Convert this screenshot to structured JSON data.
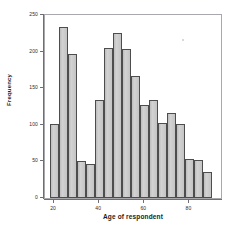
{
  "chart_data": {
    "type": "bar",
    "title": "",
    "xlabel": "Age of respondent",
    "ylabel": "Frequency",
    "ylim": [
      0,
      250
    ],
    "xlim": [
      16,
      94
    ],
    "grid": false,
    "legend": null,
    "bin_width": 4,
    "x_ticks": [
      20,
      40,
      60,
      80
    ],
    "y_ticks": [
      0,
      50,
      100,
      150,
      200,
      250
    ],
    "x_tick_labels": [
      "20",
      "40",
      "60",
      "80"
    ],
    "y_tick_labels": [
      "0",
      "50",
      "100",
      "150",
      "200",
      "250"
    ],
    "bin_starts": [
      18,
      22,
      26,
      30,
      34,
      38,
      42,
      46,
      50,
      54,
      58,
      62,
      66,
      70,
      74,
      78,
      82,
      86
    ],
    "categories": [
      "18-22",
      "22-26",
      "26-30",
      "30-34",
      "34-38",
      "38-42",
      "42-46",
      "46-50",
      "50-54",
      "54-58",
      "58-62",
      "62-66",
      "66-70",
      "70-74",
      "74-78",
      "78-82",
      "82-86",
      "86-90"
    ],
    "values": [
      101,
      233,
      197,
      51,
      47,
      134,
      205,
      226,
      203,
      167,
      127,
      134,
      103,
      116,
      101,
      53,
      52,
      36
    ],
    "bar_fill_color": "#c8c8c8",
    "bar_edge_color": "#4d4d4d",
    "axis_color": "#6f6f73",
    "frame_color": "#a9a9ad",
    "background_color": "#ffffff"
  }
}
